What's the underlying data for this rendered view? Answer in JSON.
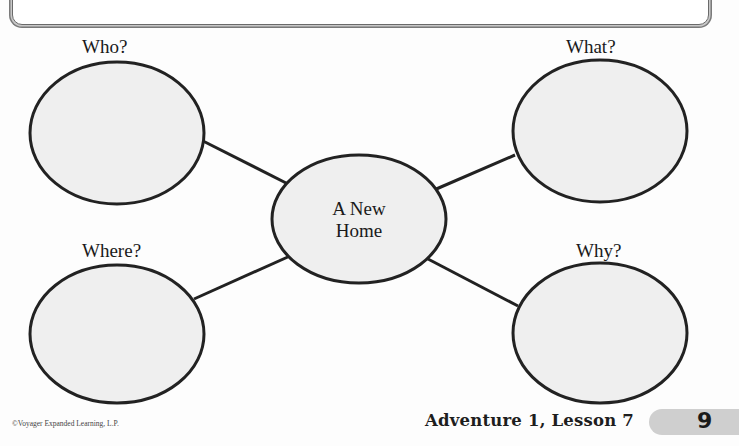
{
  "worksheet": {
    "center_topic_line1": "A New",
    "center_topic_line2": "Home",
    "nodes": [
      {
        "id": "who",
        "label": "Who?"
      },
      {
        "id": "what",
        "label": "What?"
      },
      {
        "id": "where",
        "label": "Where?"
      },
      {
        "id": "why",
        "label": "Why?"
      }
    ]
  },
  "footer": {
    "copyright": "©Voyager Expanded Learning, L.P.",
    "lesson": "Adventure 1, Lesson 7",
    "page_number": "9"
  }
}
